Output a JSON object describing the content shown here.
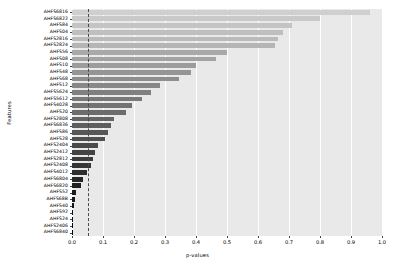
{
  "chart_data": {
    "type": "bar",
    "orientation": "horizontal",
    "title": "",
    "xlabel": "p-values",
    "ylabel": "Features",
    "xlim": [
      0.0,
      1.0
    ],
    "xticks": [
      "0.0",
      "0.1",
      "0.2",
      "0.3",
      "0.4",
      "0.5",
      "0.6",
      "0.7",
      "0.8",
      "0.9",
      "1.0"
    ],
    "xtick_values": [
      0.0,
      0.1,
      0.2,
      0.3,
      0.4,
      0.5,
      0.6,
      0.7,
      0.8,
      0.9,
      1.0
    ],
    "grid": true,
    "legend": "none",
    "annotations": [
      {
        "name": "significance-threshold",
        "type": "vline",
        "value": 0.05,
        "style": "dashed",
        "color": "#4a4a4a"
      }
    ],
    "categories": [
      "AHFS6816",
      "AHFS6822",
      "AHFS84",
      "AHFS04",
      "AHFS2816",
      "AHFS2824",
      "AHFS56",
      "AHFS08",
      "AHFS10",
      "AHFS48",
      "AHFS68",
      "AHFS12",
      "AHFS5624",
      "AHFS5612",
      "AHFS4028",
      "AHFS20",
      "AHFS2808",
      "AHFS6836",
      "AHFS86",
      "AHFS28",
      "AHFS2404",
      "AHFS2412",
      "AHFS2812",
      "AHFS2408",
      "AHFS4012",
      "AHFS6804",
      "AHFS6820",
      "AHFS52",
      "AHFS68B",
      "AHFS40",
      "AHFS92",
      "AHFS24",
      "AHFS2406",
      "AHFS6840"
    ],
    "values": [
      0.96,
      0.8,
      0.71,
      0.68,
      0.665,
      0.655,
      0.5,
      0.465,
      0.4,
      0.385,
      0.345,
      0.285,
      0.255,
      0.225,
      0.195,
      0.175,
      0.135,
      0.125,
      0.115,
      0.105,
      0.085,
      0.075,
      0.068,
      0.062,
      0.048,
      0.035,
      0.028,
      0.012,
      0.009,
      0.007,
      0.004,
      0.003,
      0.002,
      0.001
    ],
    "bar_colors": [
      "#cfcfcf",
      "#c9c9c9",
      "#c4c4c4",
      "#bfbfbf",
      "#bababa",
      "#b5b5b5",
      "#a9a9a9",
      "#a3a3a3",
      "#9c9c9c",
      "#959595",
      "#8e8e8e",
      "#878787",
      "#808080",
      "#797979",
      "#737373",
      "#6c6c6c",
      "#656565",
      "#5e5e5e",
      "#575757",
      "#505050",
      "#494949",
      "#434343",
      "#3c3c3c",
      "#353535",
      "#2e2e2e",
      "#272727",
      "#202020",
      "#1c1c1c",
      "#191919",
      "#151515",
      "#121212",
      "#0e0e0e",
      "#0a0a0a",
      "#060606"
    ]
  },
  "plot_style": {
    "plot_background": "#e9e9e9",
    "figure_background": "#ffffff",
    "gridline_color": "#ffffff"
  }
}
